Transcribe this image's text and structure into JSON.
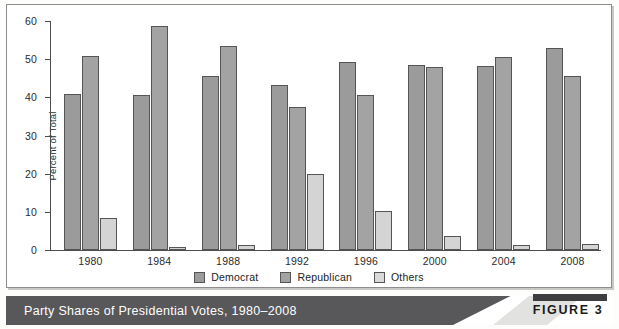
{
  "figure": {
    "caption": "Party Shares of Presidential Votes, 1980–2008",
    "badge_label": "FIGURE 3"
  },
  "legend": {
    "position": "bottom-center",
    "items": [
      {
        "label": "Democrat",
        "color": "#9b9b9b"
      },
      {
        "label": "Republican",
        "color": "#a3a3a3"
      },
      {
        "label": "Others",
        "color": "#d9d9d9"
      }
    ]
  },
  "chart_data": {
    "type": "bar",
    "title": "Party Shares of Presidential Votes, 1980–2008",
    "xlabel": "",
    "ylabel": "Percent of Total",
    "ylim": [
      0,
      60
    ],
    "yticks": [
      0,
      10,
      20,
      30,
      40,
      50,
      60
    ],
    "grid": false,
    "legend_position": "bottom-center",
    "categories": [
      "1980",
      "1984",
      "1988",
      "1992",
      "1996",
      "2000",
      "2004",
      "2008"
    ],
    "series": [
      {
        "name": "Democrat",
        "color": "#9b9b9b",
        "values": [
          41.0,
          40.6,
          45.7,
          43.3,
          49.2,
          48.4,
          48.3,
          52.9
        ]
      },
      {
        "name": "Republican",
        "color": "#a3a3a3",
        "values": [
          50.8,
          58.8,
          53.4,
          37.5,
          40.7,
          47.9,
          50.7,
          45.7
        ]
      },
      {
        "name": "Others",
        "color": "#d4d4d4",
        "values": [
          8.4,
          0.7,
          1.2,
          19.9,
          10.2,
          3.8,
          1.2,
          1.6
        ]
      }
    ]
  }
}
